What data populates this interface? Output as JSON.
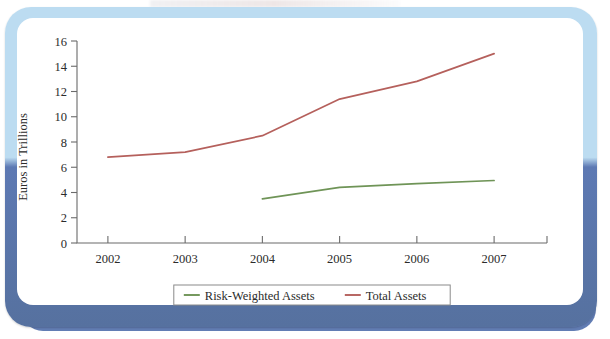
{
  "figure": {
    "frame_color_top": "#bcdcf1",
    "frame_color_bottom": "#5d79b3",
    "background": "#ffffff"
  },
  "chart_data": {
    "type": "line",
    "title": "",
    "xlabel": "",
    "ylabel": "Euros in Trillions",
    "categories": [
      "2002",
      "2003",
      "2004",
      "2005",
      "2006",
      "2007"
    ],
    "x": [
      2002,
      2003,
      2004,
      2005,
      2006,
      2007
    ],
    "xlim": [
      2001.6,
      2007.4
    ],
    "ylim": [
      0,
      16
    ],
    "yticks": [
      0,
      2,
      4,
      6,
      8,
      10,
      12,
      14,
      16
    ],
    "ytick_labels": [
      "0",
      "2",
      "4",
      "6",
      "8",
      "10",
      "12",
      "14",
      "16"
    ],
    "xtick_labels": [
      "2002",
      "2003",
      "2004",
      "2005",
      "2006",
      "2007"
    ],
    "grid": false,
    "legend_position": "bottom-center",
    "series": [
      {
        "name": "Risk-Weighted Assets",
        "color": "#6f9457",
        "x": [
          2004,
          2005,
          2006,
          2007
        ],
        "values": [
          3.5,
          4.4,
          4.7,
          4.95
        ]
      },
      {
        "name": "Total Assets",
        "color": "#b5605c",
        "x": [
          2002,
          2003,
          2004,
          2005,
          2006,
          2007
        ],
        "values": [
          6.8,
          7.2,
          8.5,
          11.4,
          12.8,
          15.0
        ]
      }
    ],
    "legend": [
      "Risk-Weighted Assets",
      "Total Assets"
    ]
  }
}
